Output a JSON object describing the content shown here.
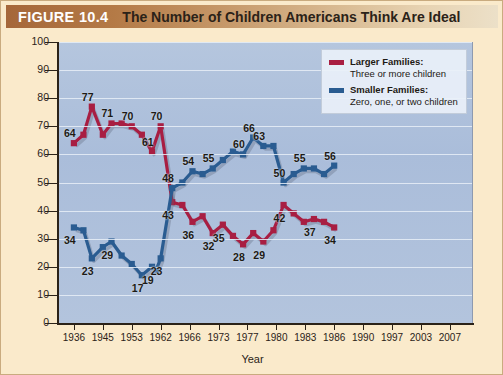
{
  "banner": {
    "figure_number": "FIGURE 10.4",
    "title": "The Number of Children Americans Think Are Ideal"
  },
  "legend": {
    "position": "top-right",
    "items": [
      {
        "name": "Larger Families:",
        "detail": "Three or more children",
        "color": "#a81e42"
      },
      {
        "name": "Smaller Families:",
        "detail": "Zero, one, or two children",
        "color": "#2a5c91"
      }
    ]
  },
  "chart_data": {
    "type": "line",
    "title": "The Number of Children Americans Think Are Ideal",
    "xlabel": "Year",
    "ylabel": "Percentage",
    "ylim": [
      0,
      100
    ],
    "ytick_values": [
      0,
      10,
      20,
      30,
      40,
      50,
      60,
      70,
      80,
      90,
      100
    ],
    "ytick_labels": [
      "0",
      "10",
      "20",
      "30",
      "40",
      "50",
      "60",
      "70",
      "80",
      "90",
      "100"
    ],
    "categories": [
      "1936",
      "1945",
      "1953",
      "1962",
      "1966",
      "1973",
      "1977",
      "1980",
      "1983",
      "1986",
      "1990",
      "1997",
      "2003",
      "2007"
    ],
    "grid": true,
    "series": [
      {
        "name": "Larger Families: Three or more children",
        "color": "#a81e42",
        "points": [
          {
            "x": 0.0,
            "value": 64,
            "label": "64"
          },
          {
            "x": 0.33,
            "value": 67,
            "label": ""
          },
          {
            "x": 0.62,
            "value": 77,
            "label": "77"
          },
          {
            "x": 1.0,
            "value": 67,
            "label": ""
          },
          {
            "x": 1.3,
            "value": 71,
            "label": "71"
          },
          {
            "x": 1.65,
            "value": 71,
            "label": ""
          },
          {
            "x": 2.0,
            "value": 70,
            "label": "70"
          },
          {
            "x": 2.35,
            "value": 67,
            "label": ""
          },
          {
            "x": 2.7,
            "value": 61,
            "label": "61"
          },
          {
            "x": 3.0,
            "value": 70,
            "label": "70"
          },
          {
            "x": 3.4,
            "value": 43,
            "label": "43"
          },
          {
            "x": 3.75,
            "value": 42,
            "label": ""
          },
          {
            "x": 4.1,
            "value": 36,
            "label": "36"
          },
          {
            "x": 4.45,
            "value": 38,
            "label": ""
          },
          {
            "x": 4.8,
            "value": 32,
            "label": "32"
          },
          {
            "x": 5.15,
            "value": 35,
            "label": "35"
          },
          {
            "x": 5.5,
            "value": 31,
            "label": ""
          },
          {
            "x": 5.85,
            "value": 28,
            "label": "28"
          },
          {
            "x": 6.2,
            "value": 32,
            "label": ""
          },
          {
            "x": 6.55,
            "value": 29,
            "label": "29"
          },
          {
            "x": 6.9,
            "value": 33,
            "label": ""
          },
          {
            "x": 7.25,
            "value": 42,
            "label": "42"
          },
          {
            "x": 7.6,
            "value": 39,
            "label": ""
          },
          {
            "x": 7.95,
            "value": 36,
            "label": ""
          },
          {
            "x": 8.3,
            "value": 37,
            "label": "37"
          },
          {
            "x": 8.65,
            "value": 36,
            "label": ""
          },
          {
            "x": 9.0,
            "value": 34,
            "label": "34"
          }
        ]
      },
      {
        "name": "Smaller Families: Zero, one, or two children",
        "color": "#2a5c91",
        "points": [
          {
            "x": 0.0,
            "value": 34,
            "label": "34"
          },
          {
            "x": 0.33,
            "value": 33,
            "label": ""
          },
          {
            "x": 0.62,
            "value": 23,
            "label": "23"
          },
          {
            "x": 1.0,
            "value": 27,
            "label": ""
          },
          {
            "x": 1.3,
            "value": 29,
            "label": "29"
          },
          {
            "x": 1.65,
            "value": 24,
            "label": ""
          },
          {
            "x": 2.0,
            "value": 21,
            "label": ""
          },
          {
            "x": 2.35,
            "value": 17,
            "label": "17"
          },
          {
            "x": 2.7,
            "value": 20,
            "label": "19"
          },
          {
            "x": 2.85,
            "value": 19,
            "label": ""
          },
          {
            "x": 3.0,
            "value": 23,
            "label": "23"
          },
          {
            "x": 3.4,
            "value": 48,
            "label": "48"
          },
          {
            "x": 3.75,
            "value": 50,
            "label": ""
          },
          {
            "x": 4.1,
            "value": 54,
            "label": "54"
          },
          {
            "x": 4.45,
            "value": 53,
            "label": ""
          },
          {
            "x": 4.8,
            "value": 55,
            "label": "55"
          },
          {
            "x": 5.15,
            "value": 58,
            "label": ""
          },
          {
            "x": 5.5,
            "value": 61,
            "label": ""
          },
          {
            "x": 5.85,
            "value": 60,
            "label": "60"
          },
          {
            "x": 6.2,
            "value": 66,
            "label": "66"
          },
          {
            "x": 6.55,
            "value": 63,
            "label": "63"
          },
          {
            "x": 6.9,
            "value": 63,
            "label": ""
          },
          {
            "x": 7.25,
            "value": 50,
            "label": "50"
          },
          {
            "x": 7.6,
            "value": 53,
            "label": ""
          },
          {
            "x": 7.95,
            "value": 55,
            "label": "55"
          },
          {
            "x": 8.3,
            "value": 55,
            "label": ""
          },
          {
            "x": 8.65,
            "value": 53,
            "label": ""
          },
          {
            "x": 9.0,
            "value": 56,
            "label": "56"
          }
        ]
      }
    ]
  }
}
